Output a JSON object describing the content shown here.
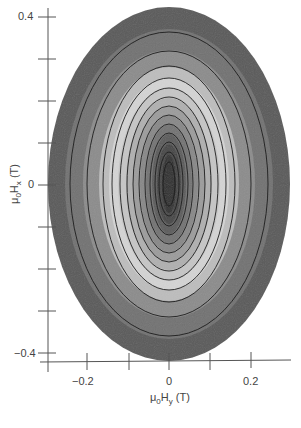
{
  "chart_data": {
    "type": "heatmap",
    "subtype": "filled-contour",
    "title": "",
    "xlabel": "μ0Hy (T)",
    "ylabel": "μ0Hx (T)",
    "xlim": [
      -0.28,
      0.3
    ],
    "ylim": [
      -0.42,
      0.42
    ],
    "x_ticks": [
      -0.2,
      0,
      0.2
    ],
    "x_tick_labels": [
      "−0.2",
      "0",
      "0.2"
    ],
    "x_minor_ticks": [
      -0.1,
      0.1
    ],
    "y_ticks": [
      0.4,
      0,
      -0.4
    ],
    "y_tick_labels": [
      "0.4",
      "0",
      "−0.4"
    ],
    "y_minor_ticks": [
      0.3,
      0.2,
      0.1,
      -0.1,
      -0.2,
      -0.3
    ],
    "grid": false,
    "legend": null,
    "colormap": "grayscale",
    "center": {
      "x": 0,
      "y": 0
    },
    "outer_boundary": {
      "x_halfwidth": 0.29,
      "y_halfwidth": 0.42
    },
    "bands": [
      {
        "rx": 121,
        "ry": 177,
        "color": "#5a5a5a"
      },
      {
        "rx": 104,
        "ry": 155,
        "color": "#727272"
      },
      {
        "rx": 86,
        "ry": 134,
        "color": "#8c8c8c"
      },
      {
        "rx": 70,
        "ry": 117,
        "color": "#bdbdbd"
      },
      {
        "rx": 60,
        "ry": 106,
        "color": "#d4d4d4"
      },
      {
        "rx": 51,
        "ry": 96,
        "color": "#c6c6c6"
      },
      {
        "rx": 43,
        "ry": 86,
        "color": "#b0b0b0"
      },
      {
        "rx": 36,
        "ry": 77,
        "color": "#9c9c9c"
      },
      {
        "rx": 29,
        "ry": 68,
        "color": "#888888"
      },
      {
        "rx": 23,
        "ry": 59,
        "color": "#737373"
      },
      {
        "rx": 17,
        "ry": 50,
        "color": "#5c5c5c"
      },
      {
        "rx": 12,
        "ry": 40,
        "color": "#454545"
      },
      {
        "rx": 7,
        "ry": 29,
        "color": "#2e2e2e"
      }
    ],
    "contour_lines": [
      {
        "rx": 99,
        "ry": 152
      },
      {
        "rx": 82,
        "ry": 133
      },
      {
        "rx": 66,
        "ry": 118
      },
      {
        "rx": 57,
        "ry": 106
      },
      {
        "rx": 49,
        "ry": 96
      },
      {
        "rx": 42,
        "ry": 87
      },
      {
        "rx": 36,
        "ry": 78
      },
      {
        "rx": 30,
        "ry": 69
      },
      {
        "rx": 24,
        "ry": 60
      },
      {
        "rx": 19,
        "ry": 51
      },
      {
        "rx": 14,
        "ry": 42
      },
      {
        "rx": 10,
        "ry": 32
      },
      {
        "rx": 6,
        "ry": 22
      }
    ]
  },
  "axes": {
    "y_tick_labels": {
      "top": "0.4",
      "mid": "0",
      "bottom": "−0.4"
    },
    "x_tick_labels": {
      "left": "−0.2",
      "mid": "0",
      "right": "0.2"
    },
    "ylabel": {
      "mu": "μ",
      "sub0": "0",
      "H": "H",
      "subx": "x",
      "unit": " (T)"
    },
    "xlabel": {
      "mu": "μ",
      "sub0": "0",
      "H": "H",
      "suby": "y",
      "unit": " (T)"
    }
  }
}
